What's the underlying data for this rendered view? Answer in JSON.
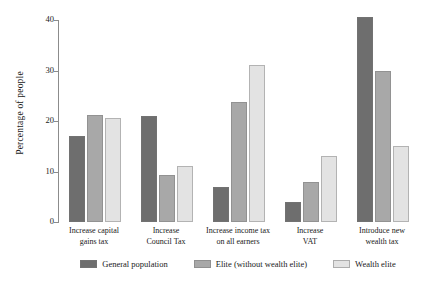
{
  "chart_data": {
    "type": "bar",
    "title": "",
    "xlabel": "",
    "ylabel": "Percentage of people",
    "ylim": [
      0,
      40
    ],
    "yticks": [
      0,
      10,
      20,
      30,
      40
    ],
    "ytick_labels": [
      "0",
      "10",
      "20",
      "30",
      "40"
    ],
    "grid": false,
    "legend_position": "bottom",
    "categories": [
      "Increase capital gains tax",
      "Increase Council Tax",
      "Increase income tax on all earners",
      "Increase VAT",
      "Introduce new wealth tax"
    ],
    "category_lines": [
      [
        "Increase capital",
        "gains tax"
      ],
      [
        "Increase",
        "Council Tax"
      ],
      [
        "Increase income tax",
        "on all earners"
      ],
      [
        "Increase",
        "VAT"
      ],
      [
        "Introduce new",
        "wealth tax"
      ]
    ],
    "series": [
      {
        "name": "General population",
        "color": "#6e6e6e",
        "values": [
          17.0,
          21.0,
          7.0,
          4.0,
          40.5
        ]
      },
      {
        "name": "Elite (without wealth elite)",
        "color": "#a8a8a8",
        "values": [
          21.2,
          9.3,
          23.8,
          8.0,
          30.0
        ]
      },
      {
        "name": "Wealth elite",
        "color": "#e3e3e3",
        "values": [
          20.5,
          11.1,
          31.0,
          13.0,
          15.0
        ]
      }
    ]
  }
}
